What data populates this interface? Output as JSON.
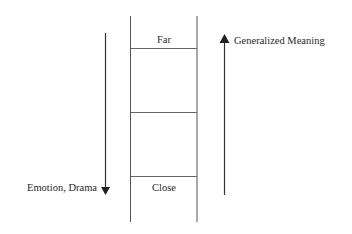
{
  "ladder": {
    "top_label": "Far",
    "bottom_label": "Close",
    "rungs": 3
  },
  "left_arrow": {
    "direction": "down",
    "label": "Emotion, Drama"
  },
  "right_arrow": {
    "direction": "up",
    "label": "Generalized Meaning"
  },
  "colors": {
    "line": "#555555",
    "arrow": "#333333",
    "text": "#2a2a2a"
  }
}
